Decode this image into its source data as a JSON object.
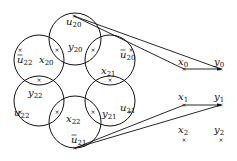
{
  "diagram": {
    "circles": [
      {
        "id": "c-top",
        "cx": 75,
        "cy": 39,
        "r": 26
      },
      {
        "id": "c-upper-left",
        "cx": 39,
        "cy": 60,
        "r": 25
      },
      {
        "id": "c-upper-right",
        "cx": 110,
        "cy": 60,
        "r": 25
      },
      {
        "id": "c-lower-left",
        "cx": 39,
        "cy": 101,
        "r": 25
      },
      {
        "id": "c-lower-right",
        "cx": 110,
        "cy": 101,
        "r": 25
      },
      {
        "id": "c-bottom",
        "cx": 75,
        "cy": 122,
        "r": 26
      }
    ],
    "labels": [
      {
        "base": "u",
        "bar": false,
        "sub": "20",
        "x": 66,
        "y": 25
      },
      {
        "base": "y",
        "bar": false,
        "sub": "20",
        "x": 68,
        "y": 50
      },
      {
        "base": "u",
        "bar": true,
        "sub": "22",
        "x": 17,
        "y": 63
      },
      {
        "base": "x",
        "bar": false,
        "sub": "20",
        "x": 39,
        "y": 63
      },
      {
        "base": "u",
        "bar": true,
        "sub": "20",
        "x": 120,
        "y": 58
      },
      {
        "base": "x",
        "bar": false,
        "sub": "21",
        "x": 101,
        "y": 74
      },
      {
        "base": "y",
        "bar": false,
        "sub": "22",
        "x": 28,
        "y": 96
      },
      {
        "base": "u",
        "bar": false,
        "sub": "22",
        "x": 14,
        "y": 116
      },
      {
        "base": "x",
        "bar": false,
        "sub": "22",
        "x": 66,
        "y": 122
      },
      {
        "base": "y",
        "bar": false,
        "sub": "21",
        "x": 102,
        "y": 117
      },
      {
        "base": "u",
        "bar": false,
        "sub": "21",
        "x": 120,
        "y": 111
      },
      {
        "base": "u",
        "bar": true,
        "sub": "21",
        "x": 71,
        "y": 143
      },
      {
        "base": "x",
        "bar": false,
        "sub": "0",
        "x": 178,
        "y": 65
      },
      {
        "base": "y",
        "bar": false,
        "sub": "0",
        "x": 214,
        "y": 65
      },
      {
        "base": "x",
        "bar": false,
        "sub": "1",
        "x": 178,
        "y": 100
      },
      {
        "base": "y",
        "bar": false,
        "sub": "1",
        "x": 214,
        "y": 100
      },
      {
        "base": "x",
        "bar": false,
        "sub": "2",
        "x": 178,
        "y": 133
      },
      {
        "base": "y",
        "bar": false,
        "sub": "2",
        "x": 214,
        "y": 133
      }
    ],
    "points": [
      {
        "x": 74,
        "y": 16
      },
      {
        "x": 57,
        "y": 50
      },
      {
        "x": 93,
        "y": 50
      },
      {
        "x": 20,
        "y": 50
      },
      {
        "x": 131,
        "y": 50
      },
      {
        "x": 39,
        "y": 80
      },
      {
        "x": 110,
        "y": 80
      },
      {
        "x": 20,
        "y": 112
      },
      {
        "x": 57,
        "y": 112
      },
      {
        "x": 93,
        "y": 112
      },
      {
        "x": 130,
        "y": 112
      },
      {
        "x": 75,
        "y": 148
      },
      {
        "x": 184,
        "y": 69
      },
      {
        "x": 221,
        "y": 69
      },
      {
        "x": 184,
        "y": 105
      },
      {
        "x": 221,
        "y": 105
      },
      {
        "x": 184,
        "y": 140
      },
      {
        "x": 221,
        "y": 140
      }
    ],
    "edges": [
      {
        "from": "u20",
        "to": "x0",
        "x1": 74,
        "y1": 16,
        "x2": 184,
        "y2": 69
      },
      {
        "from": "u20",
        "to": "y0",
        "x1": 74,
        "y1": 16,
        "x2": 221,
        "y2": 69
      },
      {
        "from": "x0",
        "to": "y0",
        "x1": 184,
        "y1": 69,
        "x2": 221,
        "y2": 69,
        "arrow": true
      },
      {
        "from": "u21bar",
        "to": "x1",
        "x1": 75,
        "y1": 148,
        "x2": 184,
        "y2": 105
      },
      {
        "from": "u21bar",
        "to": "y1",
        "x1": 75,
        "y1": 148,
        "x2": 221,
        "y2": 105
      },
      {
        "from": "x1",
        "to": "y1",
        "x1": 184,
        "y1": 105,
        "x2": 221,
        "y2": 105,
        "arrow": true
      }
    ],
    "point_marker": "×"
  }
}
